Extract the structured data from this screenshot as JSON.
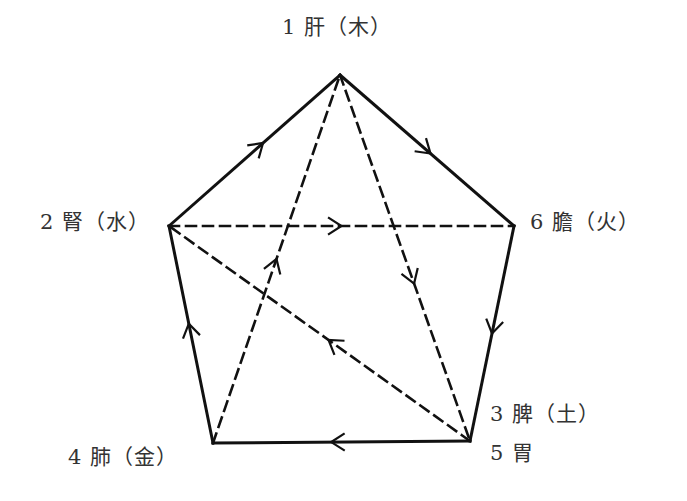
{
  "diagram": {
    "type": "pentagon-flow",
    "colors": {
      "stroke": "#111111",
      "text": "#333333",
      "background": "#ffffff"
    },
    "nodes": [
      {
        "id": "n1",
        "label": "1 肝（木）",
        "x": 340,
        "y": 75,
        "label_x": 282,
        "label_y": 10
      },
      {
        "id": "n2",
        "label": "2 腎（水）",
        "x": 169,
        "y": 226,
        "label_x": 40,
        "label_y": 205
      },
      {
        "id": "n6",
        "label": "6 膽（火）",
        "x": 514,
        "y": 226,
        "label_x": 530,
        "label_y": 205
      },
      {
        "id": "n4",
        "label": "4 肺（金）",
        "x": 213,
        "y": 443,
        "label_x": 68,
        "label_y": 440
      },
      {
        "id": "n3",
        "label": "3 脾（土）",
        "x": 470,
        "y": 441,
        "label_x": 490,
        "label_y": 397
      },
      {
        "id": "n5",
        "label": "5 胃",
        "x": 470,
        "y": 441,
        "label_x": 490,
        "label_y": 436
      }
    ],
    "edges": [
      {
        "from": "n4",
        "to": "n2",
        "style": "solid",
        "arrow_at": 0.55
      },
      {
        "from": "n2",
        "to": "n1",
        "style": "solid",
        "arrow_at": 0.55
      },
      {
        "from": "n1",
        "to": "n6",
        "style": "solid",
        "arrow_at": 0.52
      },
      {
        "from": "n6",
        "to": "n3",
        "style": "solid",
        "arrow_at": 0.5
      },
      {
        "from": "n3",
        "to": "n4",
        "style": "solid",
        "arrow_at": 0.54
      },
      {
        "from": "n2",
        "to": "n6",
        "style": "dashed",
        "arrow_at": 0.5
      },
      {
        "from": "n4",
        "to": "n1",
        "style": "dashed",
        "arrow_at": 0.5
      },
      {
        "from": "n1",
        "to": "n3",
        "style": "dashed",
        "arrow_at": 0.57
      },
      {
        "from": "n3",
        "to": "n2",
        "style": "dashed",
        "arrow_at": 0.47
      }
    ]
  }
}
